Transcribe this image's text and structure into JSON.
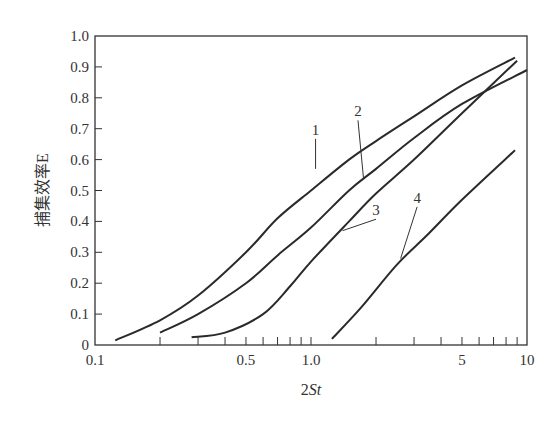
{
  "chart_data": {
    "type": "line",
    "title": "",
    "xlabel": "2St",
    "ylabel": "捕集效率E",
    "xscale": "log",
    "xlim": [
      0.1,
      10
    ],
    "ylim": [
      0,
      1.0
    ],
    "grid": false,
    "legend": "inline numeric labels 1-4 with leader lines",
    "x_tick_labels": [
      "0.1",
      "0.5",
      "1.0",
      "5",
      "10"
    ],
    "x_tick_values": [
      0.1,
      0.5,
      1.0,
      5,
      10
    ],
    "y_tick_labels": [
      "0",
      "0.1",
      "0.2",
      "0.3",
      "0.4",
      "0.5",
      "0.6",
      "0.7",
      "0.8",
      "0.9",
      "1.0"
    ],
    "series": [
      {
        "name": "1",
        "points": [
          [
            0.124,
            0.015
          ],
          [
            0.2,
            0.08
          ],
          [
            0.3,
            0.16
          ],
          [
            0.5,
            0.3
          ],
          [
            0.7,
            0.41
          ],
          [
            1.0,
            0.5
          ],
          [
            1.5,
            0.6
          ],
          [
            2,
            0.66
          ],
          [
            3,
            0.74
          ],
          [
            5,
            0.84
          ],
          [
            8.8,
            0.93
          ]
        ],
        "label_at": [
          1.05,
          0.57
        ],
        "label_text_pos": [
          1.05,
          0.68
        ]
      },
      {
        "name": "2",
        "points": [
          [
            0.2,
            0.04
          ],
          [
            0.3,
            0.1
          ],
          [
            0.5,
            0.2
          ],
          [
            0.7,
            0.29
          ],
          [
            1.0,
            0.38
          ],
          [
            1.5,
            0.5
          ],
          [
            2,
            0.57
          ],
          [
            3,
            0.67
          ],
          [
            5,
            0.78
          ],
          [
            10,
            0.89
          ]
        ],
        "label_at": [
          1.75,
          0.54
        ],
        "label_text_pos": [
          1.65,
          0.74
        ]
      },
      {
        "name": "3",
        "points": [
          [
            0.28,
            0.025
          ],
          [
            0.4,
            0.04
          ],
          [
            0.6,
            0.1
          ],
          [
            0.8,
            0.19
          ],
          [
            1.0,
            0.27
          ],
          [
            1.5,
            0.4
          ],
          [
            2,
            0.49
          ],
          [
            3,
            0.6
          ],
          [
            5,
            0.75
          ],
          [
            9,
            0.92
          ]
        ],
        "label_at": [
          1.4,
          0.37
        ],
        "label_text_pos": [
          2.0,
          0.42
        ]
      },
      {
        "name": "4",
        "points": [
          [
            1.25,
            0.02
          ],
          [
            1.7,
            0.12
          ],
          [
            2.5,
            0.26
          ],
          [
            3.5,
            0.36
          ],
          [
            5,
            0.47
          ],
          [
            8.8,
            0.63
          ]
        ],
        "label_at": [
          2.6,
          0.28
        ],
        "label_text_pos": [
          3.1,
          0.46
        ]
      }
    ]
  }
}
